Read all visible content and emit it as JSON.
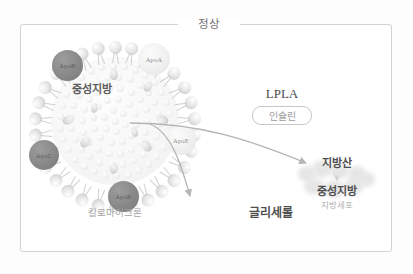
{
  "figure": {
    "title": "정상",
    "particle": {
      "core_label": "중성지방",
      "caption": "킬로마이크론",
      "apolipoproteins": [
        {
          "name": "ApoB",
          "shade": "dark"
        },
        {
          "name": "ApoA",
          "shade": "light"
        },
        {
          "name": "ApoE",
          "shade": "light"
        },
        {
          "name": "ApoC",
          "shade": "dark"
        },
        {
          "name": "ApoB",
          "shade": "dark"
        }
      ]
    },
    "enzyme": {
      "name": "LPLA",
      "modulator": "인슐린"
    },
    "products": {
      "glycerol": "글리세롤",
      "fatty_acid": "지방산",
      "stored_triglyceride": "중성지방",
      "cell_caption": "지방세포"
    },
    "colors": {
      "frame": "#d2d2d2",
      "title_text": "#6e6e6e",
      "apo_dark": "#8c8c8c",
      "apo_light": "#f0f0f0",
      "arrow": "#b4b4b4",
      "body_text": "#4f4f4f",
      "muted_text": "#a8a8a8"
    }
  }
}
